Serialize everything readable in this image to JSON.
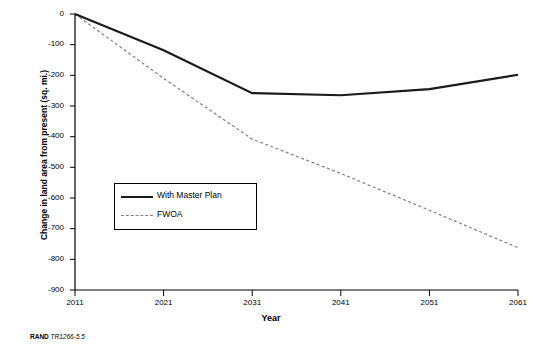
{
  "chart_data": {
    "type": "line",
    "title": "",
    "xlabel": "Year",
    "ylabel": "Change in land area from present (sq. mi.)",
    "x": [
      2011,
      2021,
      2031,
      2041,
      2051,
      2061
    ],
    "xlim": [
      2011,
      2061
    ],
    "ylim": [
      -900,
      0
    ],
    "xticks": [
      "2011",
      "2021",
      "2031",
      "2041",
      "2051",
      "2061"
    ],
    "yticks": [
      "0",
      "-100",
      "-200",
      "-300",
      "-400",
      "-500",
      "-600",
      "-700",
      "-800",
      "-900"
    ],
    "grid": false,
    "legend_position": "center-left",
    "series": [
      {
        "name": "With Master Plan",
        "color": "#1a1a1a",
        "style": "solid",
        "values": [
          0,
          -118,
          -258,
          -265,
          -245,
          -198
        ]
      },
      {
        "name": "FWOA",
        "color": "#808080",
        "style": "dashed",
        "values": [
          0,
          -210,
          -408,
          -520,
          -640,
          -762
        ]
      }
    ]
  },
  "axes": {
    "x_title": "Year",
    "y_title": "Change in land area from present (sq. mi.)"
  },
  "legend": {
    "items": [
      {
        "label": "With Master Plan"
      },
      {
        "label": "FWOA"
      }
    ]
  },
  "credit": {
    "org": "RAND",
    "ref": "TR1266-5.5"
  }
}
